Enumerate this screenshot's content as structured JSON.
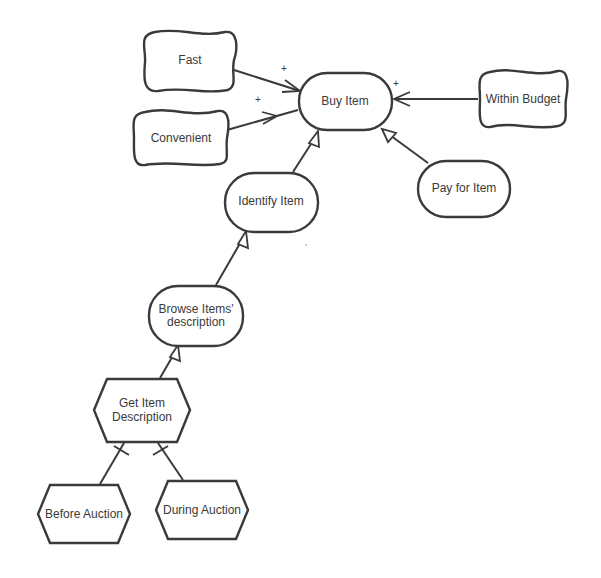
{
  "diagram": {
    "type": "i* goal model",
    "nodes": {
      "fast": {
        "label": "Fast",
        "kind": "softgoal"
      },
      "convenient": {
        "label": "Convenient",
        "kind": "softgoal"
      },
      "buy_item": {
        "label": "Buy Item",
        "kind": "goal"
      },
      "within_budget": {
        "label": "Within Budget",
        "kind": "softgoal"
      },
      "identify_item": {
        "label": "Identify Item",
        "kind": "goal"
      },
      "pay_for_item": {
        "label": "Pay for Item",
        "kind": "goal"
      },
      "browse_items": {
        "label_line1": "Browse Items'",
        "label_line2": "description",
        "kind": "goal"
      },
      "get_item_description": {
        "label_line1": "Get Item",
        "label_line2": "Description",
        "kind": "task"
      },
      "before_auction": {
        "label": "Before Auction",
        "kind": "task"
      },
      "during_auction": {
        "label": "During Auction",
        "kind": "task"
      }
    },
    "links": [
      {
        "from": "Fast",
        "to": "Buy Item",
        "type": "contribution",
        "sign": "+"
      },
      {
        "from": "Convenient",
        "to": "Buy Item",
        "type": "contribution",
        "sign": "+"
      },
      {
        "from": "Within Budget",
        "to": "Buy Item",
        "type": "contribution",
        "sign": "+"
      },
      {
        "from": "Identify Item",
        "to": "Buy Item",
        "type": "means-end"
      },
      {
        "from": "Pay for Item",
        "to": "Buy Item",
        "type": "means-end"
      },
      {
        "from": "Browse Items' description",
        "to": "Identify Item",
        "type": "means-end"
      },
      {
        "from": "Get Item Description",
        "to": "Browse Items' description",
        "type": "means-end"
      },
      {
        "from": "Before Auction",
        "to": "Get Item Description",
        "type": "decomposition"
      },
      {
        "from": "During Auction",
        "to": "Get Item Description",
        "type": "decomposition"
      }
    ],
    "signs": {
      "fast_sign": "+",
      "convenient_sign": "+",
      "budget_sign": "+"
    }
  }
}
